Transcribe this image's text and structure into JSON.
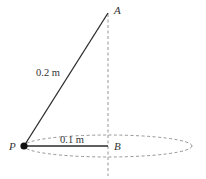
{
  "diagram": {
    "type": "conical-pendulum",
    "points": {
      "A": {
        "label": "A",
        "x": 108,
        "y": 13
      },
      "P": {
        "label": "P",
        "x": 24,
        "y": 146
      },
      "B": {
        "label": "B",
        "x": 108,
        "y": 146
      }
    },
    "labels": {
      "string_length": "0.2 m",
      "radius": "0.1 m"
    },
    "colors": {
      "line": "#2a2a2a",
      "dashed": "#888888",
      "text": "#333333",
      "bob": "#111111"
    }
  }
}
